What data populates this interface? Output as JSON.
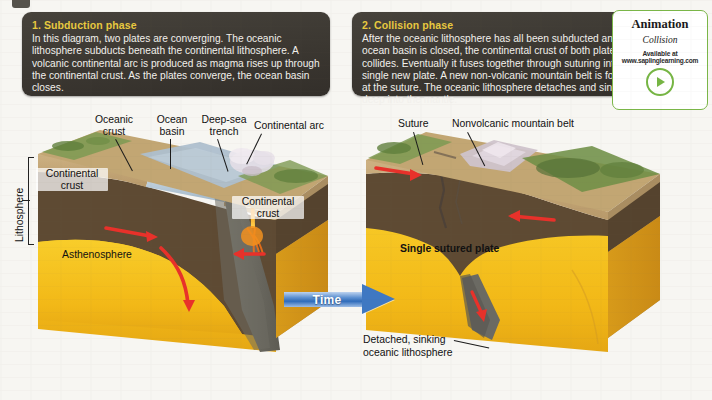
{
  "figure": {
    "background_color": "#f7f6f2"
  },
  "panels": [
    {
      "id": "subduction",
      "title": "1. Subduction phase",
      "body": "In this diagram, two plates are converging. The oceanic lithosphere subducts beneath the continental lithosphere. A volcanic continental arc is produced as magma rises up through the continental crust. As the plates converge, the ocean basin closes.",
      "title_color": "#e8c93f",
      "background_color": "#3b3731"
    },
    {
      "id": "collision",
      "title": "2. Collision phase",
      "body": "After the oceanic lithosphere has all been subducted and the ocean basin is closed, the continental crust of both plates collides. Eventually it fuses together through suturing into a single new plate. A new non-volcanic mountain belt is formed at the suture. The oceanic lithosphere detaches and sinks deep into the mantle.",
      "title_color": "#e8c93f",
      "background_color": "#3b3731"
    }
  ],
  "animation_card": {
    "title": "Animation",
    "subtitle": "Collision",
    "available_label": "Available at",
    "url": "www.saplinglearning.com",
    "play_icon": "play-icon",
    "border_color": "#7ab648",
    "accent_color": "#76b544"
  },
  "time_arrow": {
    "label": "Time",
    "color": "#3f78c2",
    "direction": "right"
  },
  "left_diagram": {
    "name": "subduction-block-diagram",
    "labels": {
      "oceanic_crust": "Oceanic\ncrust",
      "ocean_basin": "Ocean\nbasin",
      "deep_sea_trench": "Deep-sea\ntrench",
      "continental_arc": "Continental arc",
      "continental_crust_left": "Continental\ncrust",
      "continental_crust_right": "Continental\ncrust",
      "asthenosphere": "Asthenosphere",
      "lithosphere": "Lithosphere"
    }
  },
  "right_diagram": {
    "name": "collision-block-diagram",
    "labels": {
      "suture": "Suture",
      "nonvolcanic_mountain_belt": "Nonvolcanic mountain belt",
      "single_sutured_plate": "Single sutured plate",
      "detached_sinking": "Detached, sinking\noceanic lithosphere"
    }
  },
  "colors": {
    "continental_crust": "#c2a673",
    "mantle_lithosphere": "#5e4a33",
    "asthenosphere": "#f5c21b",
    "asthenosphere_shadow": "#d99b1c",
    "ocean_water": "#b6c9d8",
    "oceanic_slab": "#6b6a63",
    "magma": "#f07017",
    "arrow_red": "#e8312a",
    "vegetation": "#6f8f47"
  }
}
